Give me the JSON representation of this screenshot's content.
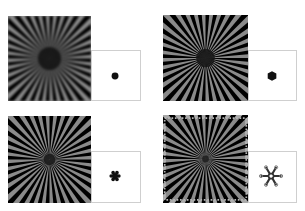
{
  "figure": {
    "panels": [
      {
        "id": "top-left",
        "star": {
          "spokes": 36,
          "center_blur": "strong",
          "edge_ringing": false
        },
        "psf": {
          "shape": "disk",
          "label": "round dot"
        }
      },
      {
        "id": "top-right",
        "star": {
          "spokes": 36,
          "center_blur": "moderate",
          "edge_ringing": false
        },
        "psf": {
          "shape": "hexagon",
          "label": "hexagonal dot"
        }
      },
      {
        "id": "bottom-left",
        "star": {
          "spokes": 36,
          "center_blur": "light",
          "edge_ringing": false
        },
        "psf": {
          "shape": "six-lobed",
          "label": "six-lobed blob"
        }
      },
      {
        "id": "bottom-right",
        "star": {
          "spokes": 36,
          "center_blur": "minimal",
          "edge_ringing": true
        },
        "psf": {
          "shape": "six-armed-star",
          "label": "six-armed star with ring tips"
        }
      }
    ],
    "colors": {
      "star_background": "#8a8a8a",
      "spoke": "#000000",
      "psf_background": "#ffffff",
      "psf_border": "#cfcfcf",
      "psf_mark": "#111111"
    }
  }
}
